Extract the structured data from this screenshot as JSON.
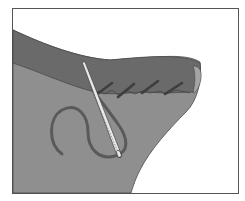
{
  "illustration": {
    "subject": "Hand-sewn hem stitch on folded fabric with needle and thread",
    "colors": {
      "background": "#ffffff",
      "frame": "#555555",
      "fabric_main": "#8f8f8f",
      "fabric_hem": "#6a6a6a",
      "fabric_edge": "#4a4a4a",
      "stitch": "#3e3e3e",
      "thread": "#5a5a5a",
      "needle": "#e8e8e8",
      "needle_outline": "#444444"
    },
    "stitches": [
      {
        "x1": 96,
        "y1": 95,
        "x2": 112,
        "y2": 83
      },
      {
        "x1": 118,
        "y1": 97,
        "x2": 134,
        "y2": 84
      },
      {
        "x1": 142,
        "y1": 93,
        "x2": 158,
        "y2": 81
      },
      {
        "x1": 165,
        "y1": 94,
        "x2": 182,
        "y2": 83
      }
    ]
  }
}
